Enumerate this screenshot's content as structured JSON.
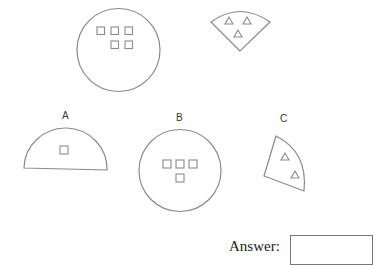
{
  "puzzle": {
    "top_figures": {
      "circle": {
        "shape": "circle",
        "contents": "squares",
        "count": 5
      },
      "sector": {
        "shape": "quarter-circle-sector",
        "contents": "triangles",
        "count": 3
      }
    },
    "options": [
      {
        "label": "A",
        "shape": "semicircle",
        "contents": "squares",
        "count": 1
      },
      {
        "label": "B",
        "shape": "circle",
        "contents": "squares",
        "count": 4
      },
      {
        "label": "C",
        "shape": "quarter-circle-sector",
        "contents": "triangles",
        "count": 2
      }
    ],
    "answer": {
      "label": "Answer:",
      "value": ""
    }
  },
  "colors": {
    "stroke": "#8a8a8a",
    "text": "#222222",
    "background": "#ffffff"
  }
}
